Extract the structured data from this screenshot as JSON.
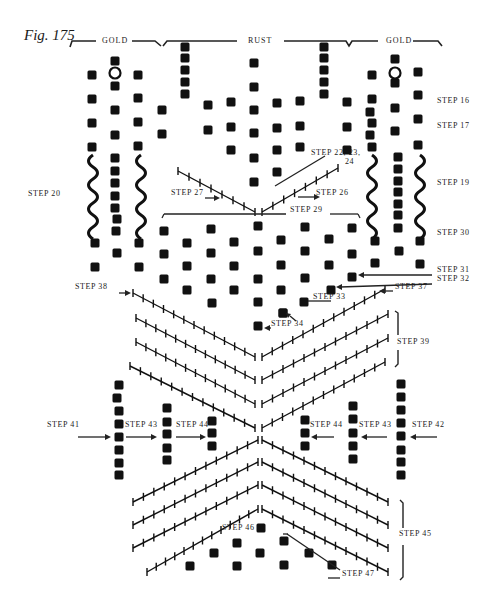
{
  "figure": {
    "title": "Fig. 175",
    "sections": [
      {
        "label": "GOLD",
        "x": 100
      },
      {
        "label": "RUST",
        "x": 249
      },
      {
        "label": "GOLD",
        "x": 387
      }
    ]
  },
  "steps": [
    {
      "id": "step16",
      "label": "STEP 16",
      "x": 437,
      "y": 101
    },
    {
      "id": "step17",
      "label": "STEP 17",
      "x": 437,
      "y": 126
    },
    {
      "id": "step19",
      "label": "STEP 19",
      "x": 437,
      "y": 183
    },
    {
      "id": "step20",
      "label": "STEP 20",
      "x": 28,
      "y": 194
    },
    {
      "id": "step22",
      "label": "STEP 22, 23,",
      "x": 311,
      "y": 153
    },
    {
      "id": "step22b",
      "label": "24",
      "x": 345,
      "y": 162
    },
    {
      "id": "step26",
      "label": "STEP 26",
      "x": 316,
      "y": 193
    },
    {
      "id": "step27",
      "label": "STEP 27",
      "x": 171,
      "y": 193
    },
    {
      "id": "step29",
      "label": "STEP 29",
      "x": 290,
      "y": 210
    },
    {
      "id": "step30",
      "label": "STEP 30",
      "x": 437,
      "y": 233
    },
    {
      "id": "step31",
      "label": "STEP 31",
      "x": 437,
      "y": 270
    },
    {
      "id": "step32",
      "label": "STEP 32",
      "x": 437,
      "y": 279
    },
    {
      "id": "step33",
      "label": "STEP 33",
      "x": 313,
      "y": 297
    },
    {
      "id": "step34",
      "label": "STEP 34",
      "x": 271,
      "y": 324
    },
    {
      "id": "step37",
      "label": "STEP 37",
      "x": 395,
      "y": 287
    },
    {
      "id": "step38",
      "label": "STEP 38",
      "x": 75,
      "y": 287
    },
    {
      "id": "step39",
      "label": "STEP 39",
      "x": 397,
      "y": 342
    },
    {
      "id": "step41",
      "label": "STEP 41",
      "x": 47,
      "y": 425
    },
    {
      "id": "step43L",
      "label": "STEP 43",
      "x": 125,
      "y": 425
    },
    {
      "id": "step44L",
      "label": "STEP 44",
      "x": 176,
      "y": 425
    },
    {
      "id": "step44R",
      "label": "STEP 44",
      "x": 310,
      "y": 425
    },
    {
      "id": "step43R",
      "label": "STEP 43",
      "x": 359,
      "y": 425
    },
    {
      "id": "step42",
      "label": "STEP 42",
      "x": 412,
      "y": 425
    },
    {
      "id": "step45",
      "label": "STEP 45",
      "x": 399,
      "y": 534
    },
    {
      "id": "step46",
      "label": "STEP 46",
      "x": 222,
      "y": 528
    },
    {
      "id": "step47",
      "label": "STEP 47",
      "x": 342,
      "y": 574
    }
  ],
  "legend": {
    "square": "bead",
    "circle": "open ring",
    "wavy": "twisted cord",
    "ticked_line": "stitched chevron row"
  }
}
